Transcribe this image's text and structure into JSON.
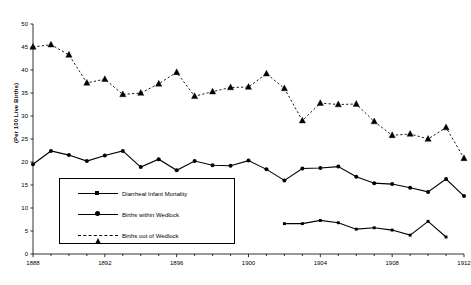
{
  "chart_data": {
    "type": "line",
    "title": "",
    "xlabel": "",
    "ylabel": "(Per 100 Live Births)",
    "xlim": [
      1888,
      1912
    ],
    "ylim": [
      0,
      50
    ],
    "ytick_step": 5,
    "xtick_step": 4,
    "grid": false,
    "legend_position": "lower-left",
    "x": [
      1888,
      1889,
      1890,
      1891,
      1892,
      1893,
      1894,
      1895,
      1896,
      1897,
      1898,
      1899,
      1900,
      1901,
      1902,
      1903,
      1904,
      1905,
      1906,
      1907,
      1908,
      1909,
      1910,
      1911,
      1912
    ],
    "ytick_labels": [
      "0",
      "5",
      "10",
      "15",
      "20",
      "25",
      "30",
      "35",
      "40",
      "45",
      "50"
    ],
    "xtick_labels": [
      "1888",
      "1892",
      "1896",
      "1900",
      "1904",
      "1908",
      "1912"
    ],
    "series": [
      {
        "name": "Diarrheal Infant Mortality",
        "marker": "square",
        "line": "solid",
        "x": [
          1902,
          1903,
          1904,
          1905,
          1906,
          1907,
          1908,
          1909,
          1910,
          1911,
          1912
        ],
        "values": [
          6.6,
          6.6,
          7.3,
          6.8,
          5.4,
          5.7,
          5.2,
          4.1,
          7.1,
          3.7,
          null
        ]
      },
      {
        "name": "Births within Wedlock",
        "marker": "circle",
        "line": "solid",
        "x": [
          1888,
          1889,
          1890,
          1891,
          1892,
          1893,
          1894,
          1895,
          1896,
          1897,
          1898,
          1899,
          1900,
          1901,
          1902,
          1903,
          1904,
          1905,
          1906,
          1907,
          1908,
          1909,
          1910,
          1911,
          1912
        ],
        "values": [
          19.5,
          22.4,
          21.5,
          20.2,
          21.4,
          22.4,
          18.9,
          20.6,
          18.2,
          20.2,
          19.3,
          19.2,
          20.3,
          18.4,
          16.0,
          18.6,
          18.7,
          19.0,
          16.8,
          15.4,
          15.2,
          14.4,
          13.5,
          16.3,
          12.6
        ]
      },
      {
        "name": "Births out of Wedlock",
        "marker": "triangle",
        "line": "dashed",
        "x": [
          1888,
          1889,
          1890,
          1891,
          1892,
          1893,
          1894,
          1895,
          1896,
          1897,
          1898,
          1899,
          1900,
          1901,
          1902,
          1903,
          1904,
          1905,
          1906,
          1907,
          1908,
          1909,
          1910,
          1911,
          1912
        ],
        "values": [
          45.0,
          45.5,
          43.3,
          37.2,
          38.0,
          34.7,
          35.0,
          37.0,
          39.5,
          34.3,
          35.3,
          36.2,
          36.3,
          39.2,
          36.0,
          29.0,
          32.8,
          32.5,
          32.6,
          28.8,
          25.8,
          26.1,
          25.0,
          27.5,
          20.8
        ]
      }
    ]
  },
  "legend": {
    "items": [
      {
        "label": "Diarrheal Infant Mortality"
      },
      {
        "label": "Births within Wedlock"
      },
      {
        "label": "Births out of Wedlock"
      }
    ]
  }
}
